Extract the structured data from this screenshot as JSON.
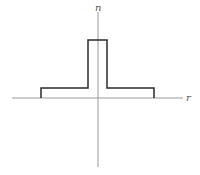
{
  "diagram": {
    "type": "step-index refractive index profile",
    "axes": {
      "vertical_label": "n",
      "horizontal_label": "r"
    },
    "colors": {
      "axis": "#999999",
      "profile": "#2a2a2a",
      "background": "#ffffff"
    },
    "profile_points_px": [
      [
        41,
        98
      ],
      [
        41,
        88
      ],
      [
        88,
        88
      ],
      [
        88,
        40
      ],
      [
        107,
        40
      ],
      [
        107,
        88
      ],
      [
        154,
        88
      ],
      [
        154,
        98
      ]
    ]
  }
}
